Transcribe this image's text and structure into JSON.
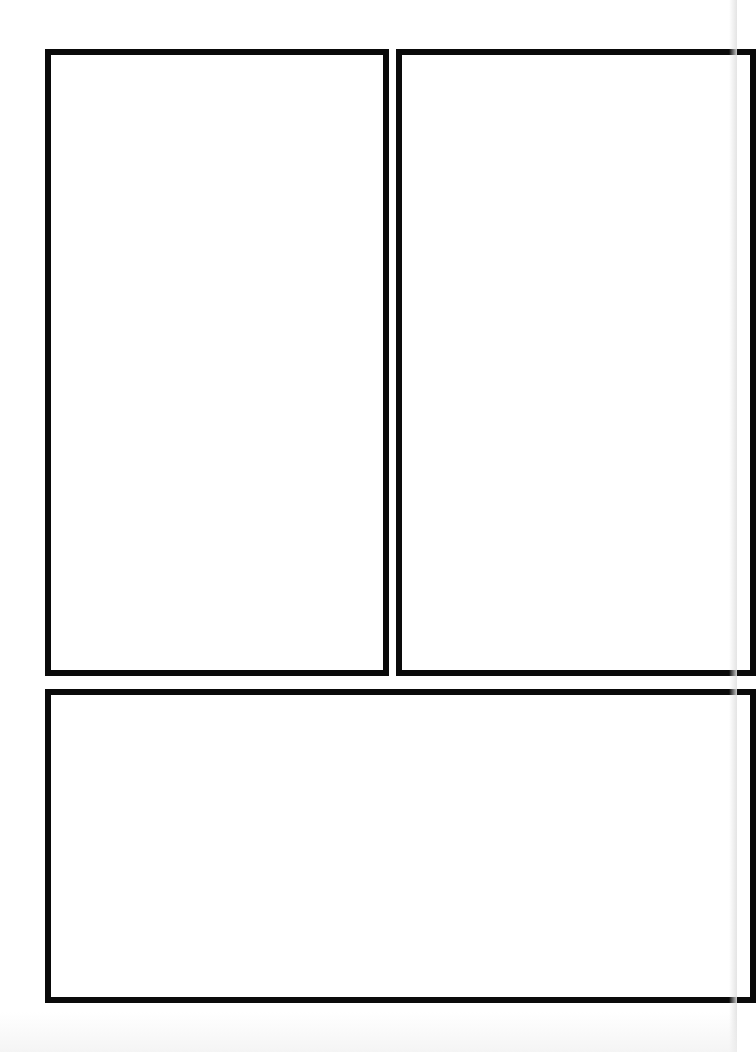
{
  "page": {
    "type": "comic-panel-template",
    "background_color": "#ffffff",
    "border_color": "#0a0a0a",
    "panels": [
      {
        "id": "top-left",
        "content": ""
      },
      {
        "id": "top-right",
        "content": ""
      },
      {
        "id": "bottom",
        "content": ""
      }
    ]
  }
}
